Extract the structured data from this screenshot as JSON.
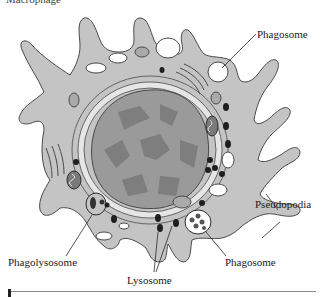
{
  "figure": {
    "top_cut_text": "Macrophage",
    "labels": {
      "phagosome_top": "Phagosome",
      "pseudopodia": "Pseudopodia",
      "phagolysosome": "Phagolysosome",
      "lysosome": "Lysosome",
      "phagosome_bottom": "Phagosome"
    },
    "colors": {
      "cytoplasm": "#c4c4c4",
      "outline": "#4a4a4a",
      "nucleus": "#9a9a9a",
      "chromatin": "#7e7e7e",
      "lysosome": "#1e1e1e",
      "vacuole": "#ffffff",
      "er": "#e6e6e6"
    }
  }
}
